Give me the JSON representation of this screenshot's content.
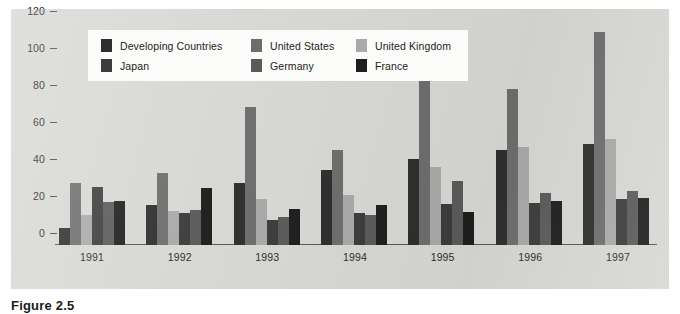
{
  "caption": "Figure 2.5",
  "colors": {
    "panel_background": "#d7d7d4",
    "legend_background": "#fbfbfa",
    "axis": "#575757",
    "developing_countries": "#2e2e2e",
    "united_states": "#6d6d6d",
    "united_kingdom": "#a9a9a9",
    "japan": "#3c3c3c",
    "germany": "#5a5a5a",
    "france": "#1e1e1e"
  },
  "legend": {
    "items": [
      {
        "label": "Developing Countries",
        "color": "#2e2e2e",
        "swatch": "legend-swatch-developing-countries"
      },
      {
        "label": "United States",
        "color": "#6d6d6d",
        "swatch": "legend-swatch-united-states"
      },
      {
        "label": "United Kingdom",
        "color": "#a9a9a9",
        "swatch": "legend-swatch-united-kingdom"
      },
      {
        "label": "Japan",
        "color": "#3c3c3c",
        "swatch": "legend-swatch-japan"
      },
      {
        "label": "Germany",
        "color": "#5a5a5a",
        "swatch": "legend-swatch-germany"
      },
      {
        "label": "France",
        "color": "#1e1e1e",
        "swatch": "legend-swatch-france"
      }
    ]
  },
  "chart_data": {
    "type": "bar",
    "title": "",
    "subtitle": "",
    "xlabel": "",
    "ylabel": "",
    "grid": false,
    "legend_position": "top-left-inside",
    "categories": [
      "1991",
      "1992",
      "1993",
      "1994",
      "1995",
      "1996",
      "1997"
    ],
    "ylim": [
      0,
      120
    ],
    "yticks": [
      0,
      20,
      40,
      60,
      80,
      100,
      120
    ],
    "ytick_labels": [
      "0",
      "20",
      "40",
      "60",
      "80",
      "100",
      "120"
    ],
    "series": [
      {
        "name": "Developing Countries",
        "color": "#2e2e2e",
        "values": [
          9,
          21.5,
          33.5,
          40.5,
          46.5,
          51.5,
          54.5
        ]
      },
      {
        "name": "United States",
        "color": "#6d6d6d",
        "values": [
          33.5,
          39,
          74.5,
          51.5,
          93,
          84.5,
          115
        ]
      },
      {
        "name": "United Kingdom",
        "color": "#a9a9a9",
        "values": [
          16,
          18.5,
          25,
          27,
          42,
          53,
          57.5
        ]
      },
      {
        "name": "Japan",
        "color": "#3c3c3c",
        "values": [
          31.5,
          17.5,
          13.5,
          17.5,
          22,
          22.5,
          25
        ]
      },
      {
        "name": "Germany",
        "color": "#5a5a5a",
        "values": [
          23.5,
          19,
          15,
          16,
          34.5,
          28,
          29
        ]
      },
      {
        "name": "France",
        "color": "#1e1e1e",
        "values": [
          24,
          31,
          19.5,
          21.5,
          18,
          24,
          25.5
        ]
      }
    ]
  }
}
